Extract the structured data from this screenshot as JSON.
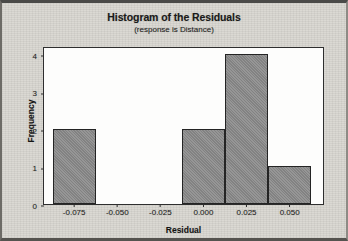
{
  "chart_data": {
    "type": "bar",
    "title": "Histogram of the Residuals",
    "subtitle": "(response is Distance)",
    "xlabel": "Residual",
    "ylabel": "Frequency",
    "grid": false,
    "legend": null,
    "bin_width": 0.025,
    "xlim": [
      -0.0925,
      0.0705
    ],
    "ylim": [
      0,
      4.2
    ],
    "xticks": [
      -0.075,
      -0.05,
      -0.025,
      0.0,
      0.025,
      0.05
    ],
    "xtick_labels": [
      "-0.075",
      "-0.050",
      "-0.025",
      "0.000",
      "0.025",
      "0.050"
    ],
    "yticks": [
      0,
      1,
      2,
      3,
      4
    ],
    "ytick_labels": [
      "0",
      "1",
      "2",
      "3",
      "4"
    ],
    "bars": [
      {
        "left": -0.0875,
        "right": -0.0625,
        "center": -0.075,
        "value": 2
      },
      {
        "left": -0.0125,
        "right": 0.0125,
        "center": 0.0,
        "value": 2
      },
      {
        "left": 0.0125,
        "right": 0.0375,
        "center": 0.025,
        "value": 4
      },
      {
        "left": 0.0375,
        "right": 0.0625,
        "center": 0.05,
        "value": 1
      }
    ],
    "categories": [
      "-0.075",
      "0.000",
      "0.025",
      "0.050"
    ],
    "values": [
      2,
      2,
      4,
      1
    ],
    "colors": {
      "bar_fill": "#8a8a8a",
      "bar_edge": "#242424",
      "plot_background": "#fdfdfc",
      "page_background": "#d9d7d1",
      "axis": "#2e2e2e",
      "text": "#1a1a1a"
    }
  }
}
